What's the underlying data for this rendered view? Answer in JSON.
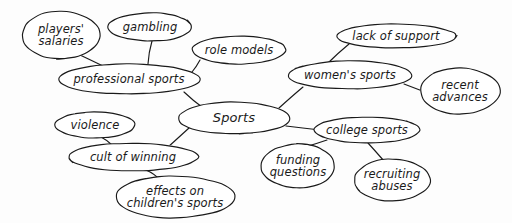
{
  "diagram": {
    "title": "Sports",
    "type": "concept-map",
    "style": "hand-drawn-ellipses",
    "background_color": "#fdfdfd",
    "stroke_color": "#1a1a1a",
    "text_color": "#1a1a1a"
  },
  "nodes": [
    {
      "id": "players-salaries",
      "label": "players'\nsalaries",
      "cx": 61,
      "cy": 35,
      "rx": 39,
      "ry": 24,
      "font_size": 11.5,
      "shape": "ellipse"
    },
    {
      "id": "gambling",
      "label": "gambling",
      "cx": 150,
      "cy": 27,
      "rx": 42,
      "ry": 14,
      "font_size": 11.5,
      "shape": "ellipse"
    },
    {
      "id": "role-models",
      "label": "role models",
      "cx": 239,
      "cy": 50,
      "rx": 47,
      "ry": 14,
      "font_size": 11.5,
      "shape": "ellipse"
    },
    {
      "id": "professional-sports",
      "label": "professional sports",
      "cx": 129,
      "cy": 79,
      "rx": 71,
      "ry": 15,
      "font_size": 11.5,
      "shape": "ellipse"
    },
    {
      "id": "lack-of-support",
      "label": "lack of support",
      "cx": 396,
      "cy": 36,
      "rx": 60,
      "ry": 12,
      "font_size": 11.5,
      "shape": "ellipse"
    },
    {
      "id": "womens-sports",
      "label": "women's sports",
      "cx": 350,
      "cy": 75,
      "rx": 62,
      "ry": 14,
      "font_size": 11.5,
      "shape": "ellipse"
    },
    {
      "id": "recent-advances",
      "label": "recent\nadvances",
      "cx": 460,
      "cy": 91,
      "rx": 40,
      "ry": 23,
      "font_size": 11.5,
      "shape": "ellipse"
    },
    {
      "id": "sports",
      "label": "Sports",
      "cx": 234,
      "cy": 118,
      "rx": 56,
      "ry": 16,
      "font_size": 13,
      "shape": "ellipse"
    },
    {
      "id": "college-sports",
      "label": "college sports",
      "cx": 367,
      "cy": 130,
      "rx": 53,
      "ry": 13,
      "font_size": 11.5,
      "shape": "ellipse"
    },
    {
      "id": "funding-questions",
      "label": "funding\nquestions",
      "cx": 298,
      "cy": 166,
      "rx": 37,
      "ry": 22,
      "font_size": 11.5,
      "shape": "ellipse"
    },
    {
      "id": "recruiting-abuses",
      "label": "recruiting\nabuses",
      "cx": 392,
      "cy": 180,
      "rx": 38,
      "ry": 21,
      "font_size": 11.5,
      "shape": "ellipse"
    },
    {
      "id": "violence",
      "label": "violence",
      "cx": 95,
      "cy": 125,
      "rx": 40,
      "ry": 13,
      "font_size": 11.5,
      "shape": "ellipse"
    },
    {
      "id": "cult-of-winning",
      "label": "cult of winning",
      "cx": 133,
      "cy": 157,
      "rx": 65,
      "ry": 14,
      "font_size": 11.5,
      "shape": "ellipse"
    },
    {
      "id": "effects-on-childrens-sports",
      "label": "effects on\nchildren's sports",
      "cx": 175,
      "cy": 197,
      "rx": 60,
      "ry": 21,
      "font_size": 11.5,
      "shape": "ellipse"
    }
  ],
  "edges": [
    {
      "id": "edge-players-salaries",
      "from": "players-salaries",
      "to": "professional-sports",
      "x1": 80,
      "y1": 55,
      "x2": 103,
      "y2": 66
    },
    {
      "id": "edge-gambling",
      "from": "gambling",
      "to": "professional-sports",
      "x1": 152,
      "y1": 41,
      "x2": 148,
      "y2": 64
    },
    {
      "id": "edge-role-models",
      "from": "role-models",
      "to": "professional-sports",
      "x1": 200,
      "y1": 60,
      "x2": 192,
      "y2": 72
    },
    {
      "id": "edge-professional-sports-sports",
      "from": "professional-sports",
      "to": "sports",
      "x1": 184,
      "y1": 92,
      "x2": 202,
      "y2": 107
    },
    {
      "id": "edge-lack-of-support",
      "from": "lack-of-support",
      "to": "womens-sports",
      "x1": 349,
      "y1": 44,
      "x2": 328,
      "y2": 63
    },
    {
      "id": "edge-sports-womens-sports",
      "from": "sports",
      "to": "womens-sports",
      "x1": 279,
      "y1": 108,
      "x2": 303,
      "y2": 87
    },
    {
      "id": "edge-recent-advances",
      "from": "womens-sports",
      "to": "recent-advances",
      "x1": 404,
      "y1": 84,
      "x2": 425,
      "y2": 92
    },
    {
      "id": "edge-sports-college-sports",
      "from": "sports",
      "to": "college-sports",
      "x1": 286,
      "y1": 126,
      "x2": 320,
      "y2": 130
    },
    {
      "id": "edge-funding-questions",
      "from": "college-sports",
      "to": "funding-questions",
      "x1": 327,
      "y1": 140,
      "x2": 305,
      "y2": 147
    },
    {
      "id": "edge-recruiting-abuses",
      "from": "college-sports",
      "to": "recruiting-abuses",
      "x1": 368,
      "y1": 143,
      "x2": 384,
      "y2": 161
    },
    {
      "id": "edge-sports-cult-of-winning",
      "from": "sports",
      "to": "cult-of-winning",
      "x1": 189,
      "y1": 128,
      "x2": 167,
      "y2": 148
    },
    {
      "id": "edge-violence",
      "from": "violence",
      "to": "cult-of-winning",
      "x1": 101,
      "y1": 137,
      "x2": 112,
      "y2": 145
    },
    {
      "id": "edge-effects-on-childrens-sports",
      "from": "cult-of-winning",
      "to": "effects-on-childrens-sports",
      "x1": 146,
      "y1": 170,
      "x2": 160,
      "y2": 180
    }
  ]
}
